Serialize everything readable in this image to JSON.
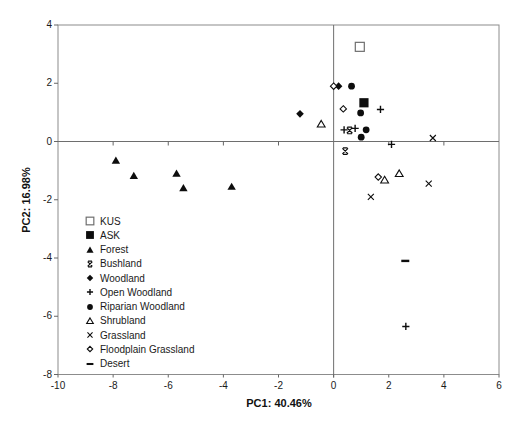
{
  "chart_data": {
    "type": "scatter",
    "title": "",
    "xlabel": "PC1: 40.46%",
    "ylabel": "PC2: 16.98%",
    "xlim": [
      -10,
      6
    ],
    "ylim": [
      -8,
      4
    ],
    "x_ticks": [
      -10,
      -8,
      -6,
      -4,
      -2,
      0,
      2,
      4,
      6
    ],
    "y_ticks": [
      4,
      2,
      0,
      -2,
      -4,
      -6,
      -8
    ],
    "grid": false,
    "zero_lines": true,
    "legend_position": "inside-lower-left",
    "series": [
      {
        "name": "KUS",
        "marker": "square-open",
        "points": [
          [
            0.95,
            3.25
          ]
        ]
      },
      {
        "name": "ASK",
        "marker": "square-filled",
        "points": [
          [
            1.1,
            1.33
          ]
        ]
      },
      {
        "name": "Forest",
        "marker": "triangle-filled",
        "points": [
          [
            -7.9,
            -0.65
          ],
          [
            -7.25,
            -1.18
          ],
          [
            -5.7,
            -1.1
          ],
          [
            -5.45,
            -1.6
          ],
          [
            -3.7,
            -1.55
          ]
        ]
      },
      {
        "name": "Bushland",
        "marker": "x-serif",
        "points": [
          [
            0.58,
            0.38
          ],
          [
            0.42,
            -0.33
          ]
        ]
      },
      {
        "name": "Woodland",
        "marker": "diamond-filled",
        "points": [
          [
            0.18,
            1.9
          ],
          [
            -1.22,
            0.95
          ]
        ]
      },
      {
        "name": "Open Woodland",
        "marker": "plus",
        "points": [
          [
            1.7,
            1.1
          ],
          [
            0.38,
            0.4
          ],
          [
            0.78,
            0.45
          ],
          [
            2.1,
            -0.1
          ],
          [
            2.62,
            -6.35
          ]
        ]
      },
      {
        "name": "Riparian Woodland",
        "marker": "circle-filled",
        "points": [
          [
            0.65,
            1.9
          ],
          [
            0.98,
            0.98
          ],
          [
            1.18,
            0.4
          ],
          [
            1.0,
            0.15
          ]
        ]
      },
      {
        "name": "Shrubland",
        "marker": "triangle-open",
        "points": [
          [
            -0.45,
            0.6
          ],
          [
            1.85,
            -1.32
          ],
          [
            2.38,
            -1.1
          ]
        ]
      },
      {
        "name": "Grassland",
        "marker": "x-thin",
        "points": [
          [
            3.6,
            0.12
          ],
          [
            3.45,
            -1.45
          ],
          [
            1.35,
            -1.9
          ]
        ]
      },
      {
        "name": "Floodplain Grassland",
        "marker": "diamond-open",
        "points": [
          [
            0.0,
            1.9
          ],
          [
            0.35,
            1.12
          ],
          [
            1.62,
            -1.22
          ]
        ]
      },
      {
        "name": "Desert",
        "marker": "dash",
        "points": [
          [
            2.6,
            -4.1
          ]
        ]
      }
    ]
  },
  "colors": {
    "background": "#ffffff",
    "marker": "#0d0d0d",
    "open_marker_fill": "#ffffff",
    "kus_square_stroke": "#6f6f6f",
    "frame": "#8c8c8c",
    "zero_line": "#6e6e6e",
    "tick": "#666666",
    "text": "#1a1a1a"
  }
}
